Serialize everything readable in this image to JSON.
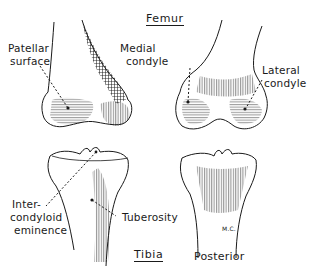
{
  "figure": {
    "titles": {
      "femur": "Femur",
      "tibia": "Tibia",
      "posterior": "Posterior"
    },
    "labels": {
      "patellar_surface_l1": "Patellar",
      "patellar_surface_l2": "surface",
      "medial_condyle_l1": "Medial",
      "medial_condyle_l2": "condyle",
      "lateral_condyle_l1": "Lateral",
      "lateral_condyle_l2": "condyle",
      "intercondyloid_l1": "Inter-",
      "intercondyloid_l2": "condyloid",
      "intercondyloid_l3": "eminence",
      "tuberosity": "Tuberosity",
      "artist_initials": "M.C."
    },
    "colors": {
      "ink": "#1a1a1a",
      "background": "#ffffff"
    }
  }
}
